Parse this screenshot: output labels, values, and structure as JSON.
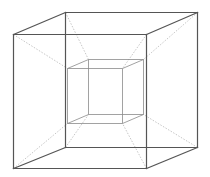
{
  "diagram": {
    "background": "#ffffff",
    "colors": {
      "outer_edges": "#555555",
      "inner_edges": "#8a8a8a",
      "connector_edges": "#b8b8b8"
    },
    "outer_cube": {
      "front_face": [
        [
          13,
          34
        ],
        [
          146,
          34
        ],
        [
          146,
          168
        ],
        [
          13,
          168
        ]
      ],
      "back_face": [
        [
          65,
          12
        ],
        [
          197,
          12
        ],
        [
          197,
          147
        ],
        [
          65,
          147
        ]
      ]
    },
    "inner_cube": {
      "front_face": [
        [
          67,
          68
        ],
        [
          122,
          68
        ],
        [
          122,
          123
        ],
        [
          67,
          123
        ]
      ],
      "back_face": [
        [
          88,
          59
        ],
        [
          143,
          59
        ],
        [
          143,
          114
        ],
        [
          88,
          114
        ]
      ]
    },
    "connectors": [
      [
        [
          13,
          34
        ],
        [
          67,
          68
        ]
      ],
      [
        [
          146,
          34
        ],
        [
          122,
          68
        ]
      ],
      [
        [
          146,
          168
        ],
        [
          122,
          123
        ]
      ],
      [
        [
          13,
          168
        ],
        [
          67,
          123
        ]
      ],
      [
        [
          65,
          12
        ],
        [
          88,
          59
        ]
      ],
      [
        [
          197,
          12
        ],
        [
          143,
          59
        ]
      ],
      [
        [
          197,
          147
        ],
        [
          143,
          114
        ]
      ],
      [
        [
          65,
          147
        ],
        [
          88,
          114
        ]
      ]
    ]
  }
}
